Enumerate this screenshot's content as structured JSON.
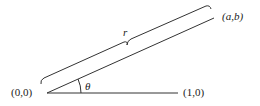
{
  "diagram": {
    "labels": {
      "origin": "(0,0)",
      "unit_point": "(1,0)",
      "point": "(a,b)",
      "radius": "r",
      "angle": "θ"
    },
    "colors": {
      "stroke": "#333333",
      "text": "#222222",
      "background": "#ffffff"
    }
  }
}
